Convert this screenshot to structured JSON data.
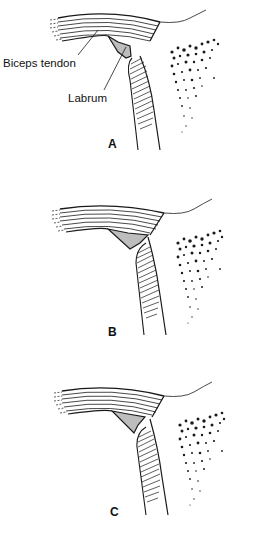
{
  "figure": {
    "title": "",
    "annotations": {
      "biceps_tendon": "Biceps tendon",
      "labrum": "Labrum"
    },
    "panels": [
      {
        "letter": "A",
        "top": 0,
        "letter_x": 108,
        "letter_y": 137,
        "labrum_path": "M108,36 L118,42 L130,46 L131,56 L126,58 L118,52 Z",
        "labrum_description": "labrum attached along glenoid rim, biceps tendon inserting into labrum"
      },
      {
        "letter": "B",
        "top": 185,
        "letter_x": 108,
        "letter_y": 140,
        "labrum_path": "M108,44 L128,48 L148,50 L140,58 L130,64 Z",
        "labrum_description": "labrum triangular, partly free from the glenoid"
      },
      {
        "letter": "C",
        "top": 365,
        "letter_x": 110,
        "letter_y": 140,
        "labrum_path": "M112,46 L128,49 L145,52 L138,60 L134,68 Z",
        "labrum_description": "labrum detached / meniscoid, separated from glenoid"
      }
    ],
    "colors": {
      "line": "#1a1a1a",
      "labrum_fill": "#bdbdbd",
      "background": "#ffffff"
    }
  }
}
